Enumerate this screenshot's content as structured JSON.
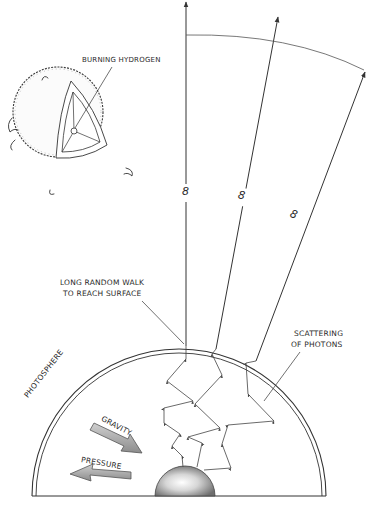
{
  "diagram": {
    "type": "illustration",
    "labels": {
      "burning_hydrogen": "BURNING HYDROGEN",
      "random_walk": [
        "LONG RANDOM WALK",
        "TO REACH SURFACE"
      ],
      "scattering": [
        "SCATTERING",
        "OF PHOTONS"
      ],
      "photosphere": "PHOTOSPHERE",
      "gravity": "GRAVITY",
      "pressure": "PRESSURE",
      "infinity_mark": "8"
    },
    "elements": [
      {
        "id": "sun-cutaway",
        "description": "Small fuzzy sun with wedge cut away showing layered interior"
      },
      {
        "id": "star-hemisphere",
        "description": "Large half-section of star with double outer line (photosphere)"
      },
      {
        "id": "core",
        "description": "Shaded hemispherical core at bottom center"
      },
      {
        "id": "photon-paths",
        "count": 3,
        "description": "Zig-zag scattering paths from core to photosphere"
      },
      {
        "id": "escape-rays",
        "count": 3,
        "description": "Straight arrows leaving surface toward infinity, each marked with 8"
      },
      {
        "id": "distance-arc",
        "description": "Arc across the escape rays at top"
      },
      {
        "id": "gravity-arrow",
        "direction": "inward"
      },
      {
        "id": "pressure-arrow",
        "direction": "outward"
      }
    ],
    "colors": {
      "ink": "#333333",
      "shading": "#9a9a9a",
      "background": "#ffffff"
    }
  }
}
